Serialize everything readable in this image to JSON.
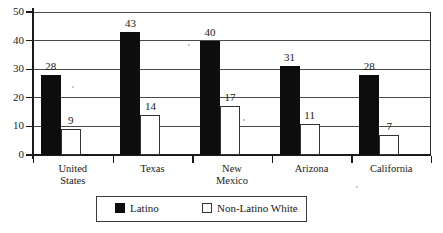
{
  "chart_data": {
    "type": "bar",
    "title": "",
    "xlabel": "",
    "ylabel": "",
    "ylim": [
      0,
      50
    ],
    "yticks": [
      0,
      10,
      20,
      30,
      40,
      50
    ],
    "grid": true,
    "legend_position": "bottom",
    "categories": [
      "United States",
      "Texas",
      "New Mexico",
      "Arizona",
      "California"
    ],
    "category_lines": [
      [
        "United",
        "States"
      ],
      [
        "Texas"
      ],
      [
        "New",
        "Mexico"
      ],
      [
        "Arizona"
      ],
      [
        "California"
      ]
    ],
    "series": [
      {
        "name": "Latino",
        "style": "filled",
        "color": "#0d0d0d",
        "values": [
          28,
          43,
          40,
          31,
          28
        ]
      },
      {
        "name": "Non-Latino White",
        "style": "open",
        "color": "#ffffff",
        "border_color": "#333333",
        "values": [
          9,
          14,
          17,
          11,
          7
        ]
      }
    ]
  },
  "legend": {
    "entries": [
      {
        "label": "Latino"
      },
      {
        "label": "Non-Latino White"
      }
    ]
  },
  "axis": {
    "y_tick_labels": [
      "0",
      "10",
      "20",
      "30",
      "40",
      "50"
    ]
  }
}
